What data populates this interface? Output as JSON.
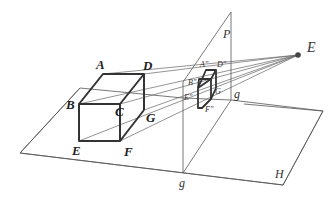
{
  "diagram": {
    "title": "",
    "labels": {
      "object_vertices": [
        "A",
        "B",
        "C",
        "D",
        "E",
        "F",
        "G"
      ],
      "image_vertices": [
        "A\"",
        "B\"",
        "D\"",
        "E\"",
        "F\"",
        "G"
      ],
      "eye_point": "E",
      "picture_plane": "P",
      "ground_line_upper": "g",
      "ground_line_lower": "g",
      "ground_plane": "H"
    },
    "label_text": {
      "A": "A",
      "B": "B",
      "C": "C",
      "D": "D",
      "E": "E",
      "F": "F",
      "G": "G",
      "A2": "A\"",
      "B2": "B\"",
      "D2": "D\"",
      "E2": "E\"",
      "F2": "F\"",
      "G2": "G",
      "eye": "E",
      "P": "P",
      "g_top": "g",
      "g_bottom": "g",
      "H": "H"
    }
  }
}
